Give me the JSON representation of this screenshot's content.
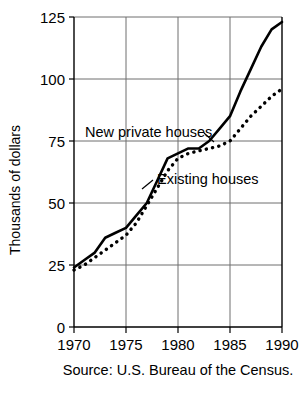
{
  "chart_data": {
    "type": "line",
    "title": "",
    "xlabel": "",
    "ylabel": "Thousands of dollars",
    "xlim": [
      1970,
      1990
    ],
    "ylim": [
      0,
      125
    ],
    "grid": true,
    "legend_position": "inline-annotations",
    "x_ticks": [
      "1970",
      "1975",
      "1980",
      "1985",
      "1990"
    ],
    "y_ticks": [
      "0",
      "25",
      "50",
      "75",
      "100",
      "125"
    ],
    "x_tick_values": [
      1970,
      1975,
      1980,
      1985,
      1990
    ],
    "y_tick_values": [
      0,
      25,
      50,
      75,
      100,
      125
    ],
    "x": [
      1970,
      1971,
      1972,
      1973,
      1974,
      1975,
      1976,
      1977,
      1978,
      1979,
      1980,
      1981,
      1982,
      1983,
      1984,
      1985,
      1986,
      1987,
      1988,
      1989,
      1990
    ],
    "series": [
      {
        "name": "New private houses",
        "style": "solid",
        "color": "#000000",
        "values": [
          24,
          27,
          30,
          36,
          38,
          40,
          45,
          50,
          59,
          68,
          70,
          72,
          72,
          75,
          80,
          85,
          95,
          104,
          113,
          120,
          123
        ]
      },
      {
        "name": "Existing houses",
        "style": "dotted",
        "color": "#000000",
        "values": [
          23,
          25,
          28,
          31,
          34,
          37,
          42,
          49,
          56,
          63,
          68,
          70,
          71,
          72,
          73,
          75,
          80,
          85,
          89,
          93,
          96
        ]
      }
    ],
    "annotations": [
      {
        "label": "New private houses",
        "target_series": "New private houses",
        "leader": true
      },
      {
        "label": "Existing houses",
        "target_series": "Existing houses",
        "leader": true
      }
    ],
    "caption": "Source: U.S. Bureau of the Census."
  }
}
